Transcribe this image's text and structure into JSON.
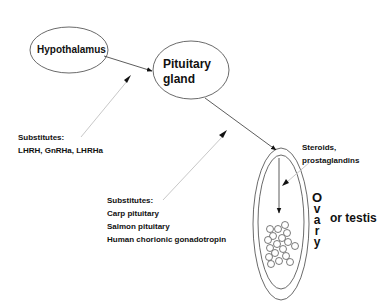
{
  "diagram": {
    "type": "hormonal-pathway",
    "nodes": {
      "hypothalamus": {
        "label": "Hypothalamus"
      },
      "pituitary": {
        "label_line1": "Pituitary",
        "label_line2": "gland"
      },
      "gonad": {
        "vertical_label": [
          "O",
          "v",
          "a",
          "r",
          "y"
        ],
        "alt_label": "or testis"
      }
    },
    "substitutes_hypothalamus": {
      "heading": "Substitutes:",
      "items": "LHRH, GnRHa, LHRHa"
    },
    "substitutes_pituitary": {
      "heading": "Substitutes:",
      "items": [
        "Carp pituitary",
        "Salmon pituitary",
        "Human chorionic gonadotropin"
      ]
    },
    "gonad_products": {
      "line1": "Steroids,",
      "line2": "prostaglandins"
    },
    "edges": [
      {
        "from": "Hypothalamus",
        "to": "Pituitary gland",
        "style": "solid"
      },
      {
        "from": "Pituitary gland",
        "to": "Ovary or testis",
        "style": "solid"
      },
      {
        "from": "Substitutes: LHRH, GnRHa, LHRHa",
        "to": "Pituitary gland",
        "style": "light"
      },
      {
        "from": "Substitutes: Carp pituitary, Salmon pituitary, Human chorionic gonadotropin",
        "to": "Ovary or testis",
        "style": "light"
      },
      {
        "from": "Steroids, prostaglandins",
        "to": "Ovary interior",
        "style": "light"
      }
    ],
    "colors": {
      "line": "#333333",
      "light_line": "#c8c8c8",
      "text": "#111111"
    }
  }
}
